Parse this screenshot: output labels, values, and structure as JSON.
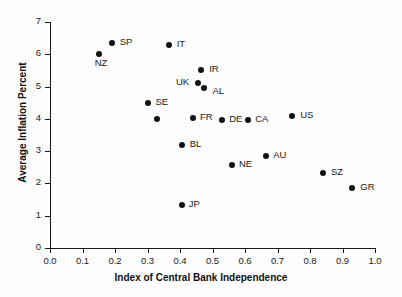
{
  "chart_data": {
    "type": "scatter",
    "title": "",
    "xlabel": "Index of Central Bank Independence",
    "ylabel": "Average Inflation Percent",
    "xlim": [
      0.0,
      1.0
    ],
    "ylim": [
      0,
      7
    ],
    "xticks": [
      "0.0",
      "0.1",
      "0.2",
      "0.3",
      "0.4",
      "0.5",
      "0.6",
      "0.7",
      "0.8",
      "0.9",
      "1.0"
    ],
    "xtick_values": [
      0.0,
      0.1,
      0.2,
      0.3,
      0.4,
      0.5,
      0.6,
      0.7,
      0.8,
      0.9,
      1.0
    ],
    "yticks": [
      "0",
      "1",
      "2",
      "3",
      "4",
      "5",
      "6",
      "7"
    ],
    "ytick_values": [
      0,
      1,
      2,
      3,
      4,
      5,
      6,
      7
    ],
    "grid": false,
    "legend": "none",
    "marker_color": "#111111",
    "points": [
      {
        "label": "SP",
        "x": 0.19,
        "y": 6.35,
        "label_dx": 8,
        "label_dy": -4
      },
      {
        "label": "NZ",
        "x": 0.15,
        "y": 6.0,
        "label_dx": -4,
        "label_dy": 6
      },
      {
        "label": "IT",
        "x": 0.365,
        "y": 6.3,
        "label_dx": 8,
        "label_dy": -4
      },
      {
        "label": "IR",
        "x": 0.465,
        "y": 5.52,
        "label_dx": 8,
        "label_dy": -4
      },
      {
        "label": "UK",
        "x": 0.455,
        "y": 5.1,
        "label_dx": -22,
        "label_dy": -4
      },
      {
        "label": "AL",
        "x": 0.475,
        "y": 4.97,
        "label_dx": 8,
        "label_dy": 0
      },
      {
        "label": "SE",
        "x": 0.3,
        "y": 4.5,
        "label_dx": 8,
        "label_dy": -4
      },
      {
        "label": "",
        "x": 0.33,
        "y": 4.01,
        "label_dx": 0,
        "label_dy": 0
      },
      {
        "label": "FR",
        "x": 0.44,
        "y": 4.02,
        "label_dx": 7,
        "label_dy": -4
      },
      {
        "label": "DE",
        "x": 0.53,
        "y": 3.97,
        "label_dx": 7,
        "label_dy": -4
      },
      {
        "label": "CA",
        "x": 0.61,
        "y": 3.97,
        "label_dx": 7,
        "label_dy": -4
      },
      {
        "label": "US",
        "x": 0.745,
        "y": 4.1,
        "label_dx": 8,
        "label_dy": -4
      },
      {
        "label": "BL",
        "x": 0.405,
        "y": 3.2,
        "label_dx": 8,
        "label_dy": -4
      },
      {
        "label": "AU",
        "x": 0.665,
        "y": 2.86,
        "label_dx": 7,
        "label_dy": -4
      },
      {
        "label": "NE",
        "x": 0.56,
        "y": 2.57,
        "label_dx": 7,
        "label_dy": -4
      },
      {
        "label": "SZ",
        "x": 0.84,
        "y": 2.31,
        "label_dx": 8,
        "label_dy": -4
      },
      {
        "label": "GR",
        "x": 0.93,
        "y": 1.86,
        "label_dx": 8,
        "label_dy": -4
      },
      {
        "label": "JP",
        "x": 0.405,
        "y": 1.32,
        "label_dx": 7,
        "label_dy": -4
      }
    ]
  }
}
